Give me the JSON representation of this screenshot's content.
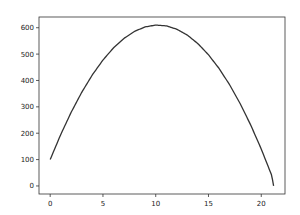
{
  "chart_data": {
    "type": "line",
    "title": "",
    "xlabel": "",
    "ylabel": "",
    "xlim": [
      -1.06,
      22.25
    ],
    "ylim": [
      -30.5,
      640.7
    ],
    "grid": false,
    "legend": null,
    "xticks": [
      "0",
      "5",
      "10",
      "15",
      "20"
    ],
    "yticks": [
      "0",
      "100",
      "200",
      "300",
      "400",
      "500",
      "600"
    ],
    "series": [
      {
        "name": "y = 100 + 100x - 4.9x^2",
        "color": "#333333",
        "x": [
          0,
          1,
          2,
          3,
          4,
          5,
          6,
          7,
          8,
          9,
          10,
          11,
          12,
          13,
          14,
          15,
          16,
          17,
          18,
          19,
          20,
          21,
          21.17
        ],
        "y": [
          100,
          195.1,
          280.4,
          355.9,
          421.6,
          477.5,
          523.6,
          559.9,
          586.4,
          603.1,
          610,
          607.1,
          594.4,
          571.9,
          539.6,
          497.5,
          445.6,
          383.9,
          312.4,
          231.1,
          140,
          39.1,
          0
        ]
      }
    ]
  }
}
